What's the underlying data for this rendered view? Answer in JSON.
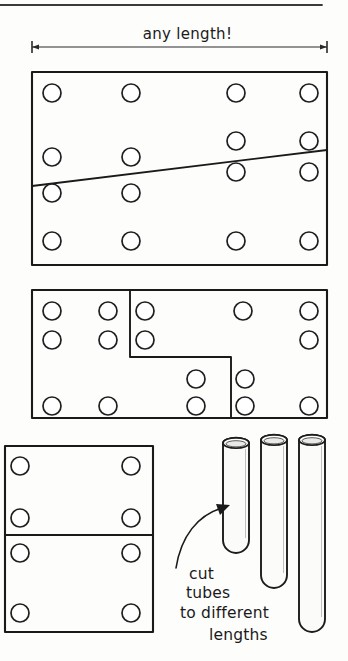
{
  "sheet": {
    "title": "any length!",
    "background_color": "#fdfdfc",
    "ink_color": "#1a1a1a"
  },
  "dimension": {
    "label": "any length!",
    "line_y": 47,
    "left_x": 32,
    "right_x": 327,
    "tick_style": "arrow-tick"
  },
  "top_rule": {
    "y": 5,
    "x_start": 0,
    "x_end": 322
  },
  "panels": [
    {
      "name": "panel-top",
      "x": 32,
      "y": 72,
      "width": 295,
      "height": 193,
      "cut": {
        "type": "diagonal",
        "from_x": 32,
        "from_y": 186,
        "to_x": 327,
        "to_y": 150
      },
      "hole_rows": [
        {
          "y": 93,
          "xs": [
            52,
            131,
            236,
            309
          ]
        },
        {
          "y": 141,
          "xs": [
            236,
            309
          ]
        },
        {
          "y": 157,
          "xs": [
            52,
            131
          ]
        },
        {
          "y": 172,
          "xs": [
            236,
            309
          ]
        },
        {
          "y": 193,
          "xs": [
            52,
            131
          ]
        },
        {
          "y": 241,
          "xs": [
            52,
            131,
            236,
            309
          ]
        }
      ]
    },
    {
      "name": "panel-middle",
      "x": 32,
      "y": 290,
      "width": 295,
      "height": 128,
      "cut": {
        "type": "step",
        "points": [
          {
            "x": 130,
            "y": 290
          },
          {
            "x": 130,
            "y": 357
          },
          {
            "x": 231,
            "y": 357
          },
          {
            "x": 231,
            "y": 418
          }
        ]
      },
      "hole_rows": [
        {
          "y": 311,
          "xs": [
            52,
            108,
            145,
            243,
            309
          ]
        },
        {
          "y": 340,
          "xs": [
            52,
            108,
            145,
            309
          ]
        },
        {
          "y": 379,
          "xs": [
            196,
            245
          ]
        },
        {
          "y": 406,
          "xs": [
            52,
            108,
            196,
            245,
            309
          ]
        }
      ]
    },
    {
      "name": "panel-bottom-left",
      "x": 5,
      "y": 446,
      "width": 148,
      "height": 186,
      "cut": {
        "type": "horizontal",
        "from_x": 5,
        "from_y": 535,
        "to_x": 153,
        "to_y": 535
      },
      "hole_rows": [
        {
          "y": 466,
          "xs": [
            20,
            131
          ]
        },
        {
          "y": 518,
          "xs": [
            20,
            131
          ]
        },
        {
          "y": 553,
          "xs": [
            20,
            131
          ]
        },
        {
          "y": 613,
          "xs": [
            20,
            131
          ]
        }
      ]
    }
  ],
  "hole_radius": 9,
  "tubes": [
    {
      "name": "tube-short",
      "cx": 236,
      "top_y": 443,
      "bottom_y": 553,
      "radius": 13
    },
    {
      "name": "tube-medium",
      "cx": 274,
      "top_y": 440,
      "bottom_y": 588,
      "radius": 13
    },
    {
      "name": "tube-long",
      "cx": 312,
      "top_y": 440,
      "bottom_y": 632,
      "radius": 13
    }
  ],
  "annotation": {
    "arrow": {
      "name": "cut-tubes-arrow",
      "path": "M 176 568 C 181 536, 198 515, 222 508",
      "head_x": 226,
      "head_y": 507
    },
    "caption_lines": [
      "cut",
      "tubes",
      "to different",
      "lengths"
    ],
    "caption_positions": [
      {
        "x": 189,
        "y": 579
      },
      {
        "x": 186,
        "y": 598
      },
      {
        "x": 180,
        "y": 618
      },
      {
        "x": 209,
        "y": 640
      }
    ]
  }
}
